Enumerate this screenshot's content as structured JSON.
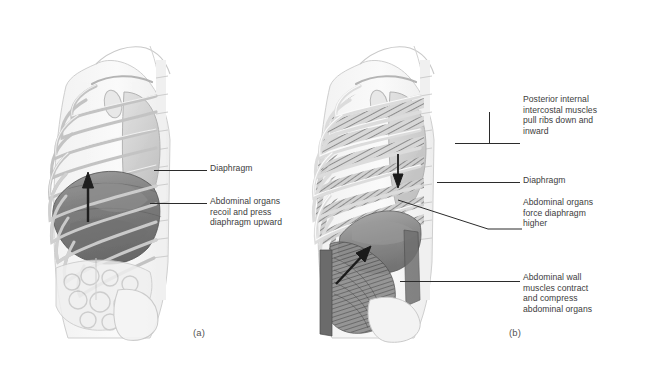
{
  "figure": {
    "background_color": "#ffffff",
    "ink_color": "#3c3c3c",
    "leader_color": "#2b2b2b"
  },
  "panels": [
    {
      "id": "a",
      "label": "(a)",
      "label_x": 193,
      "label_y": 327,
      "description": "Lateral view of thorax and abdomen showing passive expiration; diaphragm domed upward",
      "callouts": [
        {
          "name": "diaphragm",
          "text": "Diaphragm",
          "text_x": 210,
          "text_y": 163,
          "leader": {
            "x1": 154,
            "y1": 170,
            "x2": 207,
            "y2": 170
          }
        },
        {
          "name": "abdominal-organs-recoil",
          "text": "Abdominal organs\nrecoil and press\ndiaphragm upward",
          "text_x": 210,
          "text_y": 196,
          "leader": {
            "x1": 150,
            "y1": 203,
            "x2": 207,
            "y2": 203
          }
        }
      ]
    },
    {
      "id": "b",
      "label": "(b)",
      "label_x": 509,
      "label_y": 327,
      "description": "Lateral view showing forced expiration; intercostals and abdominal wall contracting",
      "callouts": [
        {
          "name": "posterior-internal-intercostal-muscles",
          "text": "Posterior internal\nintercostal muscles\npull ribs down and\ninward",
          "text_x": 523,
          "text_y": 94,
          "leader": {
            "x1": 455,
            "y1": 143,
            "x2": 520,
            "y2": 143
          }
        },
        {
          "name": "diaphragm",
          "text": "Diaphragm",
          "text_x": 523,
          "text_y": 175,
          "leader": {
            "x1": 437,
            "y1": 182,
            "x2": 520,
            "y2": 182
          }
        },
        {
          "name": "abdominal-organs-force-diaphragm",
          "text": "Abdominal organs\nforce diaphragm\nhigher",
          "text_x": 523,
          "text_y": 197,
          "leader": {
            "x1": 398,
            "y1": 200,
            "x2": 520,
            "y2": 229
          }
        },
        {
          "name": "abdominal-wall-muscles-contract",
          "text": "Abdominal wall\nmuscles contract\nand compress\nabdominal organs",
          "text_x": 523,
          "text_y": 272,
          "leader": {
            "x1": 400,
            "y1": 281,
            "x2": 520,
            "y2": 281
          }
        }
      ]
    }
  ]
}
